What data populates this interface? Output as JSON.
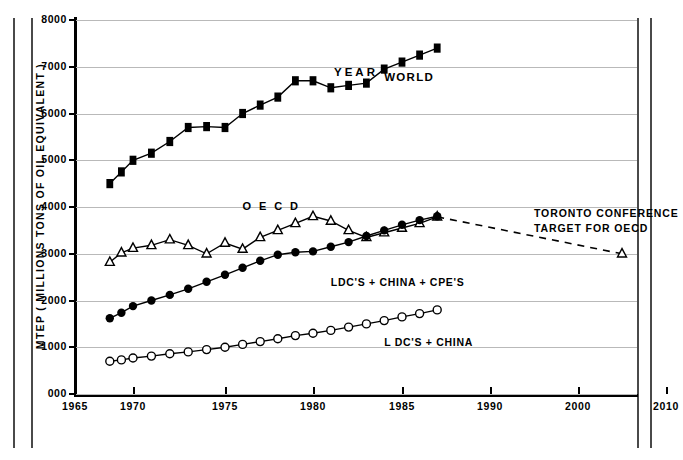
{
  "chart_data": {
    "type": "line",
    "title": "",
    "xlabel": "YEAR",
    "ylabel": "MTEP ( MILLIONS TONS OF OIL EQUIVALENT )",
    "xlim": [
      1965,
      2010
    ],
    "ylim": [
      0,
      8000
    ],
    "grid": true,
    "legend": "inline-annotations",
    "xticks": [
      "1965",
      "1970",
      "1975",
      "1980",
      "1985",
      "1990",
      "2000",
      "2010"
    ],
    "xtick_values": [
      1965,
      1970,
      1975,
      1980,
      1985,
      1990,
      2000,
      2010
    ],
    "yticks": [
      "000",
      "1000",
      "2000",
      "3000",
      "4000",
      "5000",
      "6000",
      "7000",
      "8000"
    ],
    "ytick_values": [
      0,
      1000,
      2000,
      3000,
      4000,
      5000,
      6000,
      7000,
      8000
    ],
    "series": [
      {
        "name": "WORLD",
        "marker": "filled-square",
        "style": "solid",
        "label": "WORLD",
        "x": [
          1968,
          1969,
          1970,
          1971,
          1972,
          1973,
          1974,
          1975,
          1976,
          1977,
          1978,
          1979,
          1980,
          1981,
          1982,
          1983,
          1984,
          1985,
          1986,
          1987
        ],
        "values": [
          4500,
          4750,
          5000,
          5150,
          5400,
          5700,
          5720,
          5700,
          6000,
          6180,
          6350,
          6700,
          6700,
          6550,
          6600,
          6650,
          6950,
          7100,
          7250,
          7400
        ]
      },
      {
        "name": "OECD",
        "marker": "open-triangle",
        "style": "solid",
        "label": "O E C D",
        "x": [
          1968,
          1969,
          1970,
          1971,
          1972,
          1973,
          1974,
          1975,
          1976,
          1977,
          1978,
          1979,
          1980,
          1981,
          1982,
          1983,
          1984,
          1985,
          1986,
          1987
        ],
        "values": [
          2820,
          3020,
          3120,
          3180,
          3300,
          3180,
          3000,
          3230,
          3100,
          3350,
          3500,
          3650,
          3800,
          3700,
          3500,
          3350,
          3450,
          3550,
          3650,
          3790
        ]
      },
      {
        "name": "LDC'S + CHINA + CPE'S",
        "marker": "filled-circle",
        "style": "solid",
        "label": "LDC'S + CHINA + CPE'S",
        "x": [
          1968,
          1969,
          1970,
          1971,
          1972,
          1973,
          1974,
          1975,
          1976,
          1977,
          1978,
          1979,
          1980,
          1981,
          1982,
          1983,
          1984,
          1985,
          1986,
          1987
        ],
        "values": [
          1620,
          1740,
          1880,
          2000,
          2120,
          2250,
          2400,
          2550,
          2700,
          2850,
          2980,
          3030,
          3050,
          3150,
          3250,
          3380,
          3500,
          3620,
          3720,
          3800
        ]
      },
      {
        "name": "LDC'S + CHINA",
        "marker": "open-circle",
        "style": "solid",
        "label": "L DC'S + CHINA",
        "x": [
          1968,
          1969,
          1970,
          1971,
          1972,
          1973,
          1974,
          1975,
          1976,
          1977,
          1978,
          1979,
          1980,
          1981,
          1982,
          1983,
          1984,
          1985,
          1986,
          1987
        ],
        "values": [
          700,
          730,
          770,
          810,
          860,
          900,
          950,
          1000,
          1060,
          1120,
          1180,
          1250,
          1300,
          1360,
          1430,
          1500,
          1570,
          1650,
          1720,
          1800
        ]
      },
      {
        "name": "TORONTO CONFERENCE TARGET FOR OECD",
        "marker": "open-triangle",
        "style": "dashed",
        "label": "TORONTO CONFERENCE TARGET FOR OECD",
        "x": [
          1987,
          2005
        ],
        "values": [
          3790,
          3000
        ]
      }
    ],
    "annotations": [
      {
        "text": "WORLD",
        "x": 1984,
        "y": 6900
      },
      {
        "text": "O E C D",
        "x": 1976,
        "y": 4150
      },
      {
        "text": "LDC'S + CHINA + CPE'S",
        "x": 1981,
        "y": 2520
      },
      {
        "text": "L DC'S + CHINA",
        "x": 1984,
        "y": 1250
      },
      {
        "text": "TORONTO CONFERENCE",
        "x": 1995,
        "y": 4020
      },
      {
        "text": "TARGET FOR OECD",
        "x": 1995,
        "y": 3720
      }
    ]
  },
  "axes": {
    "y_title": "MTEP ( MILLIONS TONS OF OIL EQUIVALENT )",
    "x_title": "YEAR"
  },
  "labels": {
    "world": "WORLD",
    "oecd": "O E C D",
    "ldc_china_cpe": "LDC'S + CHINA + CPE'S",
    "ldc_china": "L DC'S + CHINA",
    "toronto_line1": "TORONTO CONFERENCE",
    "toronto_line2": "TARGET FOR OECD"
  },
  "colors": {
    "ink": "#000000",
    "grid": "#b9b9b9",
    "frame": "#4a4a4a",
    "paper": "#ffffff"
  }
}
